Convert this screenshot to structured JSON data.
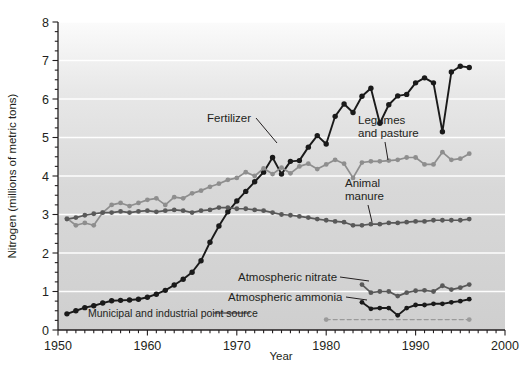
{
  "chart_data": {
    "type": "line",
    "title": "",
    "xlabel": "Year",
    "ylabel": "Nitrogen (millions of metric tons)",
    "xlim": [
      1950,
      2000
    ],
    "ylim": [
      0,
      8
    ],
    "x_ticks": [
      1950,
      1960,
      1970,
      1980,
      1990,
      2000
    ],
    "x_tick_labels": [
      "1950",
      "1960",
      "1970",
      "1980",
      "1990",
      "2000"
    ],
    "x_minor_tick_interval": 1,
    "y_ticks": [
      0,
      1,
      2,
      3,
      4,
      5,
      6,
      7,
      8
    ],
    "y_tick_labels": [
      "0",
      "1",
      "2",
      "3",
      "4",
      "5",
      "6",
      "7",
      "8"
    ],
    "y_minor_tick_interval": 0.25,
    "grid": "horizontal-white-gridlines-at-integers",
    "legend": "inline-annotations",
    "plot_background": "#d2d2d2",
    "series": [
      {
        "name": "Fertilizer",
        "color": "#1a1a1a",
        "marker": "circle",
        "linestyle": "solid",
        "x": [
          1951,
          1952,
          1953,
          1954,
          1955,
          1956,
          1957,
          1958,
          1959,
          1960,
          1961,
          1962,
          1963,
          1964,
          1965,
          1966,
          1967,
          1968,
          1969,
          1970,
          1971,
          1972,
          1973,
          1974,
          1975,
          1976,
          1977,
          1978,
          1979,
          1980,
          1981,
          1982,
          1983,
          1984,
          1985,
          1986,
          1987,
          1988,
          1989,
          1990,
          1991,
          1992,
          1993,
          1994,
          1995,
          1996
        ],
        "values": [
          0.42,
          0.5,
          0.58,
          0.63,
          0.7,
          0.76,
          0.77,
          0.78,
          0.8,
          0.85,
          0.93,
          1.03,
          1.17,
          1.32,
          1.5,
          1.8,
          2.28,
          2.7,
          3.07,
          3.35,
          3.6,
          3.85,
          4.1,
          4.48,
          4.05,
          4.38,
          4.4,
          4.75,
          5.05,
          4.83,
          5.55,
          5.87,
          5.65,
          6.07,
          6.28,
          5.37,
          5.85,
          6.08,
          6.12,
          6.42,
          6.55,
          6.42,
          5.15,
          6.7,
          6.85,
          6.82
        ],
        "annotation": "Fertilizer"
      },
      {
        "name": "Legumes and pasture",
        "color": "#8e8e8e",
        "marker": "circle",
        "linestyle": "solid",
        "x": [
          1951,
          1952,
          1953,
          1954,
          1955,
          1956,
          1957,
          1958,
          1959,
          1960,
          1961,
          1962,
          1963,
          1964,
          1965,
          1966,
          1967,
          1968,
          1969,
          1970,
          1971,
          1972,
          1973,
          1974,
          1975,
          1976,
          1977,
          1978,
          1979,
          1980,
          1981,
          1982,
          1983,
          1984,
          1985,
          1986,
          1987,
          1988,
          1989,
          1990,
          1991,
          1992,
          1993,
          1994,
          1995,
          1996
        ],
        "values": [
          2.9,
          2.72,
          2.78,
          2.72,
          3.05,
          3.25,
          3.3,
          3.22,
          3.3,
          3.38,
          3.42,
          3.25,
          3.45,
          3.42,
          3.55,
          3.62,
          3.72,
          3.8,
          3.9,
          3.95,
          4.1,
          4.0,
          4.2,
          4.05,
          4.22,
          4.07,
          4.25,
          4.32,
          4.18,
          4.3,
          4.42,
          4.32,
          3.95,
          4.35,
          4.38,
          4.38,
          4.4,
          4.42,
          4.48,
          4.48,
          4.3,
          4.3,
          4.62,
          4.42,
          4.45,
          4.58
        ],
        "annotation": "Legumes and pasture"
      },
      {
        "name": "Animal manure",
        "color": "#595959",
        "marker": "circle",
        "linestyle": "solid",
        "x": [
          1951,
          1952,
          1953,
          1954,
          1955,
          1956,
          1957,
          1958,
          1959,
          1960,
          1961,
          1962,
          1963,
          1964,
          1965,
          1966,
          1967,
          1968,
          1969,
          1970,
          1971,
          1972,
          1973,
          1974,
          1975,
          1976,
          1977,
          1978,
          1979,
          1980,
          1981,
          1982,
          1983,
          1984,
          1985,
          1986,
          1987,
          1988,
          1989,
          1990,
          1991,
          1992,
          1993,
          1994,
          1995,
          1996
        ],
        "values": [
          2.88,
          2.92,
          2.98,
          3.02,
          3.05,
          3.05,
          3.08,
          3.05,
          3.08,
          3.1,
          3.07,
          3.1,
          3.12,
          3.1,
          3.05,
          3.1,
          3.12,
          3.18,
          3.18,
          3.15,
          3.15,
          3.12,
          3.1,
          3.05,
          3.0,
          2.98,
          2.95,
          2.92,
          2.88,
          2.85,
          2.82,
          2.8,
          2.72,
          2.72,
          2.75,
          2.75,
          2.78,
          2.78,
          2.8,
          2.82,
          2.82,
          2.85,
          2.85,
          2.85,
          2.85,
          2.88
        ],
        "annotation": "Animal manure"
      },
      {
        "name": "Atmospheric nitrate",
        "color": "#595959",
        "marker": "circle",
        "linestyle": "solid",
        "x": [
          1984,
          1985,
          1986,
          1987,
          1988,
          1989,
          1990,
          1991,
          1992,
          1993,
          1994,
          1995,
          1996
        ],
        "values": [
          1.18,
          0.97,
          1.0,
          1.0,
          0.88,
          0.97,
          1.02,
          1.03,
          1.0,
          1.15,
          1.05,
          1.1,
          1.18
        ],
        "annotation": "Atmospheric nitrate"
      },
      {
        "name": "Atmospheric ammonia",
        "color": "#1a1a1a",
        "marker": "circle",
        "linestyle": "solid",
        "x": [
          1984,
          1985,
          1986,
          1987,
          1988,
          1989,
          1990,
          1991,
          1992,
          1993,
          1994,
          1995,
          1996
        ],
        "values": [
          0.72,
          0.55,
          0.57,
          0.57,
          0.38,
          0.57,
          0.65,
          0.65,
          0.68,
          0.68,
          0.72,
          0.75,
          0.8
        ],
        "annotation": "Atmospheric ammonia"
      },
      {
        "name": "Municipal and industrial point source",
        "color": "#9a9a9a",
        "marker": "circle",
        "linestyle": "dashed",
        "x": [
          1980,
          1996
        ],
        "values": [
          0.27,
          0.27
        ],
        "annotation": "Municipal and industrial point source"
      }
    ],
    "annotations": [
      {
        "text": "Fertilizer",
        "x_px": 207,
        "y_px": 122
      },
      {
        "text": "Legumes",
        "x_px": 358,
        "y_px": 124
      },
      {
        "text": "and pasture",
        "x_px": 358,
        "y_px": 137
      },
      {
        "text": "Animal",
        "x_px": 345,
        "y_px": 187
      },
      {
        "text": "manure",
        "x_px": 345,
        "y_px": 200
      },
      {
        "text": "Atmospheric nitrate",
        "x_px": 238,
        "y_px": 281
      },
      {
        "text": "Atmospheric ammonia",
        "x_px": 228,
        "y_px": 301
      },
      {
        "text": "Municipal and industrial point source",
        "x_px": 88,
        "y_px": 317
      }
    ]
  }
}
